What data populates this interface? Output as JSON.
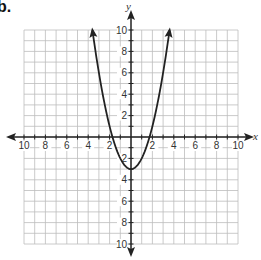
{
  "problem": {
    "label": "b."
  },
  "chart_data": {
    "type": "line",
    "title": "",
    "function": "y = x^2 - 3",
    "xlabel": "x",
    "ylabel": "y",
    "xlim": [
      -10,
      10
    ],
    "ylim": [
      -10,
      10
    ],
    "grid": true,
    "grid_step": 1,
    "x_ticks": [
      -10,
      -8,
      -6,
      -4,
      -2,
      2,
      4,
      6,
      8,
      10
    ],
    "y_ticks": [
      10,
      8,
      6,
      4,
      2,
      -2,
      -4,
      -6,
      -8,
      -10
    ],
    "x_tick_labels": [
      "10",
      "8",
      "6",
      "4",
      "2",
      "2",
      "4",
      "6",
      "8",
      "10"
    ],
    "y_tick_labels": [
      "10",
      "8",
      "6",
      "4",
      "2",
      "2",
      "4",
      "6",
      "8",
      "10"
    ],
    "series": [
      {
        "name": "parabola",
        "color": "#222222",
        "vertex": [
          0,
          -3
        ],
        "x_intercepts": [
          -1.73,
          1.73
        ],
        "endpoints_with_arrows": [
          [
            -3.6,
            10
          ],
          [
            3.6,
            10
          ]
        ],
        "x": [
          -3.6,
          -3,
          -2,
          -1.73,
          -1,
          0,
          1,
          1.73,
          2,
          3,
          3.6
        ],
        "y": [
          9.96,
          6,
          1,
          0,
          -2,
          -3,
          -2,
          0,
          1,
          6,
          9.96
        ]
      }
    ],
    "legend": null
  },
  "colors": {
    "grid": "#bdbdbd",
    "axis": "#222222",
    "curve": "#222222"
  }
}
